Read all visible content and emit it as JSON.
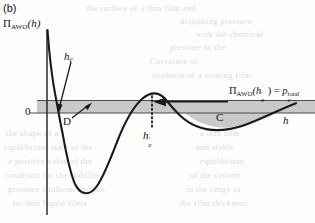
{
  "figure": {
    "panel_letter": "(b)",
    "y_axis_label_pi": "Π",
    "y_axis_label_sub": "AWO",
    "y_axis_label_arg": "(h)",
    "x_axis_label": "h",
    "zero_tick": "0",
    "curve_label_he": "h",
    "curve_label_he_sub": "e",
    "dotted_label_hep": "h",
    "dotted_label_hep_sub": "e",
    "dotted_label_hep_prime": "′",
    "region_d_label": "D",
    "region_c_label": "C",
    "annotation": {
      "pi": "Π",
      "pi_sub": "AWO",
      "arg_open": "(h",
      "arg_sub": "e",
      "arg_prime": "′",
      "arg_close": ")",
      "equals": "=",
      "rhs_base": "p",
      "rhs_sub": "c",
      "rhs_sup": "total"
    }
  },
  "colors": {
    "curve": "#1a1a1a",
    "band_fill": "#c9c9c9",
    "region_c_fill": "#c9c9c9",
    "axis": "#2b2b2b",
    "background": "#fdfdfb",
    "ghost_text": "#b9b4ab"
  },
  "chart_data": {
    "type": "line",
    "xlabel": "h",
    "ylabel": "Π_AWO(h)",
    "grid": false,
    "legend": false,
    "annotations": [
      {
        "text": "h_e",
        "role": "first-zero-crossing"
      },
      {
        "text": "h_e′",
        "role": "second-crossing-at-capillary-pressure"
      },
      {
        "text": "D",
        "role": "shaded-band-region"
      },
      {
        "text": "C",
        "role": "shaded-lobe-region"
      },
      {
        "text": "Π_AWO(h_e′) = p_c^total",
        "role": "level-line-equation"
      }
    ],
    "band": {
      "y_top": 0.42,
      "y_bottom": 0.0,
      "label": "D"
    },
    "x": [
      0.0,
      0.03,
      0.06,
      0.09,
      0.12,
      0.16,
      0.2,
      0.26,
      0.32,
      0.4,
      0.48,
      0.56,
      0.64,
      0.72,
      0.8,
      0.88,
      0.96,
      1.0
    ],
    "y": [
      3.05,
      1.55,
      0.42,
      0.0,
      -1.1,
      -2.45,
      -3.05,
      -3.28,
      -3.05,
      -1.85,
      -0.2,
      0.62,
      0.55,
      -0.05,
      -0.42,
      -0.52,
      -0.26,
      0.02
    ],
    "ylim": [
      -3.6,
      3.3
    ],
    "xlim": [
      0.0,
      1.0
    ]
  },
  "ghost_text": {
    "lines": [
      {
        "text": "the surface of a thin film and",
        "x": 86,
        "y": 3,
        "size": 8.5
      },
      {
        "text": "disjoining pressure",
        "x": 180,
        "y": 16,
        "size": 8.5
      },
      {
        "text": "with the chemical",
        "x": 196,
        "y": 29,
        "size": 8.5
      },
      {
        "text": "pressure in the",
        "x": 170,
        "y": 42,
        "size": 8.5
      },
      {
        "text": "Curvature of",
        "x": 150,
        "y": 56,
        "size": 8.5
      },
      {
        "text": "isotherm of a wetting film",
        "x": 152,
        "y": 70,
        "size": 8.5
      },
      {
        "text": "the shape of a",
        "x": 6,
        "y": 128,
        "size": 8.5
      },
      {
        "text": "equilibrium state of the",
        "x": 4,
        "y": 142,
        "size": 8.5
      },
      {
        "text": "a positive value of the",
        "x": 8,
        "y": 156,
        "size": 8.5
      },
      {
        "text": "condition for the stability",
        "x": 4,
        "y": 170,
        "size": 8.5
      },
      {
        "text": "pressure isotherm and the",
        "x": 8,
        "y": 184,
        "size": 8.5
      },
      {
        "text": "for thin liquid films",
        "x": 12,
        "y": 198,
        "size": 8.5
      },
      {
        "text": "the film thickness",
        "x": 180,
        "y": 198,
        "size": 8.5
      },
      {
        "text": "in the range of",
        "x": 186,
        "y": 184,
        "size": 8.5
      },
      {
        "text": "of the system",
        "x": 190,
        "y": 170,
        "size": 8.5
      },
      {
        "text": "equilibrium",
        "x": 200,
        "y": 156,
        "size": 8.5
      },
      {
        "text": "and stable",
        "x": 196,
        "y": 142,
        "size": 8.5
      },
      {
        "text": "a thin film",
        "x": 200,
        "y": 128,
        "size": 8.5
      }
    ]
  }
}
